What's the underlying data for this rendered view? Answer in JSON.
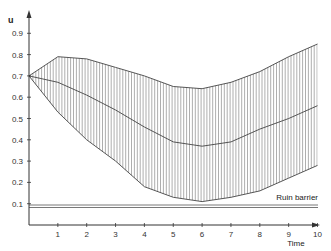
{
  "chart_data": {
    "type": "line",
    "title": "",
    "xlabel": "Time",
    "ylabel": "u",
    "xlim": [
      0,
      10
    ],
    "ylim": [
      0,
      0.97
    ],
    "x_ticks": [
      1,
      2,
      3,
      4,
      5,
      6,
      7,
      8,
      9,
      10
    ],
    "y_ticks": [
      0.1,
      0.2,
      0.3,
      0.4,
      0.5,
      0.6,
      0.7,
      0.8,
      0.9
    ],
    "grid": false,
    "x": [
      0,
      1,
      2,
      3,
      4,
      5,
      6,
      7,
      8,
      9,
      10
    ],
    "series": [
      {
        "name": "Upper bound",
        "values": [
          0.7,
          0.79,
          0.78,
          0.74,
          0.7,
          0.65,
          0.64,
          0.67,
          0.72,
          0.79,
          0.85
        ]
      },
      {
        "name": "Middle path",
        "values": [
          0.7,
          0.67,
          0.61,
          0.54,
          0.46,
          0.39,
          0.37,
          0.39,
          0.45,
          0.5,
          0.56
        ]
      },
      {
        "name": "Lower bound",
        "values": [
          0.7,
          0.53,
          0.4,
          0.3,
          0.18,
          0.13,
          0.11,
          0.13,
          0.16,
          0.22,
          0.28
        ]
      }
    ],
    "shaded_region": {
      "between": [
        "Upper bound",
        "Lower bound"
      ],
      "style": "vertical hatching"
    },
    "annotations": [
      {
        "text": "Ruin barrier",
        "type": "horizontal_line",
        "y": 0.095
      }
    ]
  },
  "labels": {
    "y_axis": "u",
    "x_axis": "Time",
    "ruin_barrier": "Ruin barrier",
    "x_ticks": [
      "1",
      "2",
      "3",
      "4",
      "5",
      "6",
      "7",
      "8",
      "9",
      "10"
    ],
    "y_ticks": [
      "0.1",
      "0.2",
      "0.3",
      "0.4",
      "0.5",
      "0.6",
      "0.7",
      "0.8",
      "0.9"
    ]
  },
  "colors": {
    "line": "#444444",
    "hatch": "#777777",
    "axis": "#333333"
  }
}
